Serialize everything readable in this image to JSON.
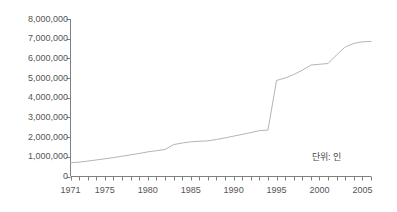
{
  "chart_data": {
    "type": "line",
    "title": "",
    "subtitle": "",
    "xlabel": "",
    "ylabel": "",
    "annotation": "단위: 인",
    "grid": false,
    "legend": "none",
    "line_color": "#b4b4b4",
    "axis_color": "#808080",
    "text_color": "#555555",
    "xlim": [
      1971,
      2006
    ],
    "ylim": [
      0,
      8000000
    ],
    "ytick_step": 1000000,
    "ytick_labels": [
      "8,000,000",
      "7,000,000",
      "6,000,000",
      "5,000,000",
      "4,000,000",
      "3,000,000",
      "2,000,000",
      "1,000,000",
      "0"
    ],
    "ytick_values": [
      8000000,
      7000000,
      6000000,
      5000000,
      4000000,
      3000000,
      2000000,
      1000000,
      0
    ],
    "xtick_labels": [
      "1971",
      "1975",
      "1980",
      "1985",
      "1990",
      "1995",
      "2000",
      "2005"
    ],
    "xtick_values": [
      1971,
      1975,
      1980,
      1985,
      1990,
      1995,
      2000,
      2005
    ],
    "xtick_minor_step": 1,
    "series": [
      {
        "name": "",
        "x": [
          1971,
          1972,
          1973,
          1974,
          1975,
          1976,
          1977,
          1978,
          1979,
          1980,
          1981,
          1982,
          1983,
          1984,
          1985,
          1986,
          1987,
          1988,
          1989,
          1990,
          1991,
          1992,
          1993,
          1994,
          1995,
          1996,
          1997,
          1998,
          1999,
          2000,
          2001,
          2002,
          2003,
          2004,
          2005,
          2006
        ],
        "values": [
          700000,
          730000,
          780000,
          840000,
          900000,
          960000,
          1030000,
          1100000,
          1170000,
          1250000,
          1310000,
          1370000,
          1620000,
          1700000,
          1760000,
          1790000,
          1810000,
          1880000,
          1960000,
          2050000,
          2140000,
          2230000,
          2330000,
          2360000,
          4880000,
          5000000,
          5180000,
          5400000,
          5660000,
          5700000,
          5740000,
          6180000,
          6580000,
          6760000,
          6840000,
          6860000
        ]
      }
    ]
  }
}
